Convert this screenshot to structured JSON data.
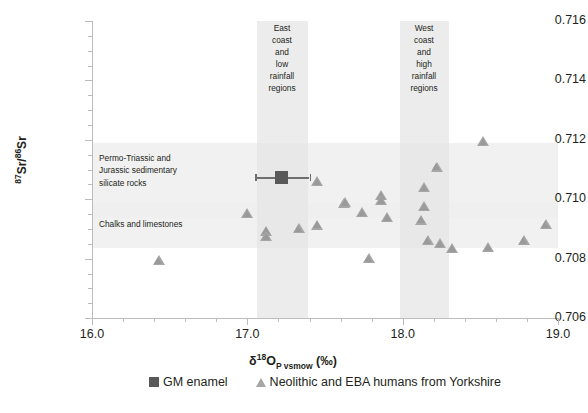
{
  "chart_data": {
    "type": "scatter",
    "title": "",
    "xlabel": "δ18OP vsmow (‰)",
    "ylabel": "87Sr/86Sr",
    "xlim": [
      16.0,
      19.0
    ],
    "ylim": [
      0.706,
      0.716
    ],
    "grid": false,
    "legend_position": "bottom",
    "x_ticks": [
      "16.0",
      "17.0",
      "18.0",
      "19.0"
    ],
    "x_tick_values": [
      16.0,
      17.0,
      18.0,
      19.0
    ],
    "x_minor_step": 0.2,
    "y_ticks": [
      "0.706",
      "0.708",
      "0.710",
      "0.712",
      "0.714",
      "0.716"
    ],
    "y_tick_values": [
      0.706,
      0.708,
      0.71,
      0.712,
      0.714,
      0.716
    ],
    "y_minor_step": 0.0005,
    "series": [
      {
        "name": "GM enamel",
        "marker": "square",
        "color": "#595959",
        "points": [
          {
            "x": 17.22,
            "y": 0.71072,
            "x_err_low": 17.05,
            "x_err_high": 17.4
          }
        ]
      },
      {
        "name": "Neolithic and EBA humans from Yorkshire",
        "marker": "triangle",
        "color": "#a6a6a6",
        "points": [
          {
            "x": 16.43,
            "y": 0.70793
          },
          {
            "x": 17.0,
            "y": 0.70951
          },
          {
            "x": 17.12,
            "y": 0.70893
          },
          {
            "x": 17.12,
            "y": 0.70875
          },
          {
            "x": 17.33,
            "y": 0.709
          },
          {
            "x": 17.45,
            "y": 0.7106
          },
          {
            "x": 17.45,
            "y": 0.70913
          },
          {
            "x": 17.62,
            "y": 0.70985
          },
          {
            "x": 17.63,
            "y": 0.7099
          },
          {
            "x": 17.74,
            "y": 0.70955
          },
          {
            "x": 17.78,
            "y": 0.708
          },
          {
            "x": 17.86,
            "y": 0.71013
          },
          {
            "x": 17.86,
            "y": 0.70995
          },
          {
            "x": 17.9,
            "y": 0.70938
          },
          {
            "x": 18.14,
            "y": 0.7104
          },
          {
            "x": 18.14,
            "y": 0.70975
          },
          {
            "x": 18.12,
            "y": 0.7093
          },
          {
            "x": 18.16,
            "y": 0.70862
          },
          {
            "x": 18.22,
            "y": 0.71108
          },
          {
            "x": 18.24,
            "y": 0.7085
          },
          {
            "x": 18.32,
            "y": 0.70835
          },
          {
            "x": 18.52,
            "y": 0.71195
          },
          {
            "x": 18.55,
            "y": 0.70838
          },
          {
            "x": 18.78,
            "y": 0.7086
          },
          {
            "x": 18.92,
            "y": 0.70915
          }
        ]
      }
    ],
    "vertical_bands": [
      {
        "label": "East coast and low rainfall regions",
        "x_start": 17.06,
        "x_end": 17.39
      },
      {
        "label": "West coast and high rainfall regions",
        "x_start": 17.98,
        "x_end": 18.3
      }
    ],
    "horizontal_bands": [
      {
        "label": "Permo-Triassic and Jurassic sedimentary silicate rocks",
        "y_start": 0.7095,
        "y_end": 0.712
      },
      {
        "label": "Chalks and limestones",
        "y_start": 0.7075,
        "y_end": 0.709
      }
    ]
  },
  "axes": {
    "y_title_pre": "87",
    "y_title_mid": "Sr/",
    "y_title_sup2": "86",
    "y_title_end": "Sr",
    "x_title_delta": "δ",
    "x_title_sup": "18",
    "x_title_o": "O",
    "x_title_sub": "P vsmow",
    "x_title_units": "(‰)"
  },
  "annotations": {
    "geology_1_line1": "Permo-Triassic and",
    "geology_1_line2": "Jurassic sedimentary",
    "geology_1_line3": "silicate rocks",
    "geology_2_line1": "Chalks and limestones",
    "band_east": "East coast and low rainfall regions",
    "band_west": "West coast and high rainfall regions"
  },
  "legend": {
    "items": [
      {
        "label": "GM enamel",
        "marker": "square"
      },
      {
        "label": "Neolithic and EBA humans from Yorkshire",
        "marker": "triangle"
      }
    ]
  }
}
